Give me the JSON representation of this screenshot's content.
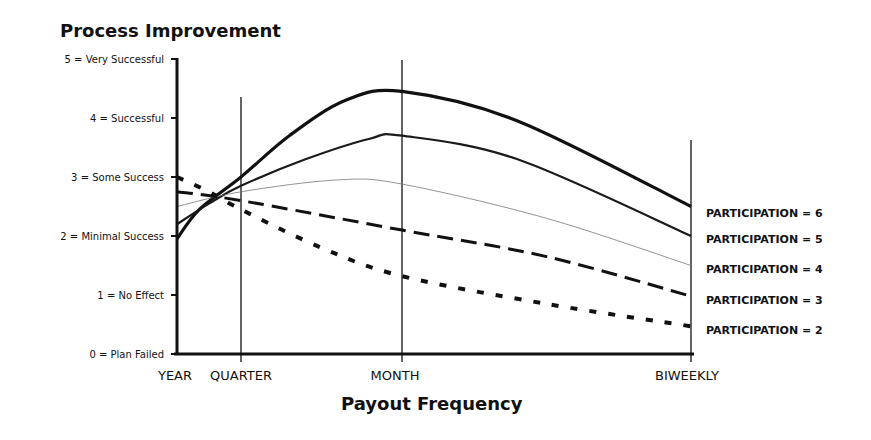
{
  "chart_data": {
    "type": "line",
    "title": "Process Improvement",
    "xlabel": "Payout Frequency",
    "ylabel": "",
    "ylim": [
      0,
      5
    ],
    "grid": false,
    "legend_placement": "right",
    "x_categories": [
      "YEAR",
      "QUARTER",
      "MONTH",
      "BIWEEKLY"
    ],
    "y_ticks": [
      {
        "value": 5,
        "label": "5 = Very Successful"
      },
      {
        "value": 4,
        "label": "4 = Successful"
      },
      {
        "value": 3,
        "label": "3 = Some Success"
      },
      {
        "value": 2,
        "label": "2 = Minimal Success"
      },
      {
        "value": 1,
        "label": "1 = No Effect"
      },
      {
        "value": 0,
        "label": "0 = Plan Failed"
      }
    ],
    "series": [
      {
        "name": "PARTICIPATION = 6",
        "style": "thick-solid",
        "points": [
          [
            0,
            1.95
          ],
          [
            0.35,
            2.45
          ],
          [
            1,
            3.0
          ],
          [
            1.6,
            3.7
          ],
          [
            2.3,
            4.3
          ],
          [
            3,
            4.45
          ],
          [
            4.2,
            3.95
          ],
          [
            6.0,
            2.5
          ]
        ],
        "values_at_categories": [
          1.95,
          3.0,
          4.45,
          2.5
        ]
      },
      {
        "name": "PARTICIPATION = 5",
        "style": "medium-solid",
        "points": [
          [
            0,
            2.2
          ],
          [
            0.5,
            2.55
          ],
          [
            1,
            2.85
          ],
          [
            1.8,
            3.3
          ],
          [
            2.6,
            3.65
          ],
          [
            3,
            3.7
          ],
          [
            4.2,
            3.3
          ],
          [
            6.0,
            2.0
          ]
        ],
        "values_at_categories": [
          2.2,
          2.85,
          3.7,
          2.0
        ]
      },
      {
        "name": "PARTICIPATION = 4",
        "style": "thin-solid",
        "points": [
          [
            0,
            2.5
          ],
          [
            1,
            2.75
          ],
          [
            2.2,
            2.95
          ],
          [
            3,
            2.88
          ],
          [
            4.5,
            2.3
          ],
          [
            6.0,
            1.5
          ]
        ],
        "values_at_categories": [
          2.5,
          2.75,
          2.88,
          1.5
        ]
      },
      {
        "name": "PARTICIPATION = 3",
        "style": "long-dash",
        "points": [
          [
            0,
            2.75
          ],
          [
            1,
            2.6
          ],
          [
            3,
            2.1
          ],
          [
            4.5,
            1.65
          ],
          [
            6.0,
            0.98
          ]
        ],
        "values_at_categories": [
          2.75,
          2.6,
          2.1,
          0.98
        ]
      },
      {
        "name": "PARTICIPATION = 2",
        "style": "dotted",
        "points": [
          [
            0,
            3.0
          ],
          [
            0.5,
            2.75
          ],
          [
            1,
            2.45
          ],
          [
            2,
            1.8
          ],
          [
            3,
            1.32
          ],
          [
            4.5,
            0.85
          ],
          [
            6.0,
            0.47
          ]
        ],
        "values_at_categories": [
          3.0,
          2.45,
          1.32,
          0.47
        ]
      }
    ],
    "x_position_note": "x coordinate in points uses a frequency index where YEAR=0, QUARTER=1, MONTH=3, BIWEEKLY=6"
  }
}
